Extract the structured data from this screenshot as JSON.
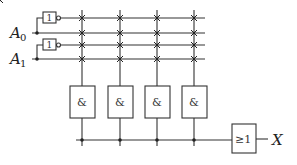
{
  "diagram": {
    "type": "programmable logic array (AND-OR matrix)",
    "inputs": [
      {
        "name": "A",
        "subscript": "0"
      },
      {
        "name": "A",
        "subscript": "1"
      }
    ],
    "inverters": [
      {
        "label": "1",
        "input": "A0"
      },
      {
        "label": "1",
        "input": "A1"
      }
    ],
    "and_gates": [
      {
        "label": "&"
      },
      {
        "label": "&"
      },
      {
        "label": "&"
      },
      {
        "label": "&"
      }
    ],
    "or_gate": {
      "label": "≥1"
    },
    "output": {
      "name": "X"
    },
    "rows": [
      "NOT A0",
      "A0",
      "NOT A1",
      "A1"
    ],
    "columns": 4,
    "crosspoint_mark": "x (programmable connection)"
  }
}
